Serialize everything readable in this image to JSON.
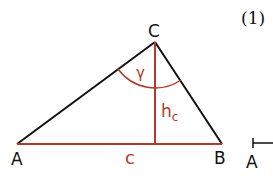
{
  "figure": {
    "number_label": "(1)",
    "colors": {
      "black": "#111111",
      "red": "#b03a2e"
    },
    "triangle": {
      "vertices": {
        "A": {
          "label": "A",
          "x": 17,
          "y": 144
        },
        "B": {
          "label": "B",
          "x": 222,
          "y": 144
        },
        "C": {
          "label": "C",
          "x": 155,
          "y": 42
        }
      },
      "side_c_label": "c",
      "altitude_label_main": "h",
      "altitude_label_sub": "c",
      "angle_label": "γ"
    },
    "partial_next_figure": {
      "label": "A"
    }
  }
}
